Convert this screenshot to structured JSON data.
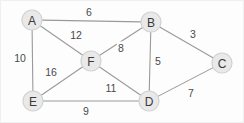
{
  "figure": {
    "background": "#fdfdfd",
    "node_fill": "#e9e9e9",
    "node_stroke": "#d2d2d2",
    "edge_color": "#9a9a9a",
    "text_color": "#3a3a3a"
  },
  "chart_data": {
    "type": "diagram",
    "title": "",
    "graph_type": "weighted-undirected-graph",
    "nodes": [
      {
        "id": "A",
        "label": "A",
        "x": 31,
        "y": 19,
        "r": 10
      },
      {
        "id": "B",
        "label": "B",
        "x": 150,
        "y": 21,
        "r": 10
      },
      {
        "id": "C",
        "label": "C",
        "x": 221,
        "y": 62,
        "r": 10
      },
      {
        "id": "D",
        "label": "D",
        "x": 148,
        "y": 100,
        "r": 10
      },
      {
        "id": "E",
        "label": "E",
        "x": 32,
        "y": 100,
        "r": 10
      },
      {
        "id": "F",
        "label": "F",
        "x": 90,
        "y": 60,
        "r": 10
      }
    ],
    "edges": [
      {
        "source": "A",
        "target": "B",
        "weight": 6,
        "label_x": 88,
        "label_y": 11
      },
      {
        "source": "A",
        "target": "F",
        "weight": 12,
        "label_x": 75,
        "label_y": 34
      },
      {
        "source": "A",
        "target": "E",
        "weight": 10,
        "label_x": 19,
        "label_y": 57
      },
      {
        "source": "B",
        "target": "C",
        "weight": 3,
        "label_x": 192,
        "label_y": 33
      },
      {
        "source": "B",
        "target": "F",
        "weight": 8,
        "label_x": 120,
        "label_y": 47
      },
      {
        "source": "B",
        "target": "D",
        "weight": 5,
        "label_x": 157,
        "label_y": 60
      },
      {
        "source": "C",
        "target": "D",
        "weight": 7,
        "label_x": 190,
        "label_y": 92
      },
      {
        "source": "D",
        "target": "F",
        "weight": 11,
        "label_x": 110,
        "label_y": 87
      },
      {
        "source": "D",
        "target": "E",
        "weight": 9,
        "label_x": 85,
        "label_y": 110
      },
      {
        "source": "E",
        "target": "F",
        "weight": 16,
        "label_x": 50,
        "label_y": 71
      }
    ],
    "node_count": 6,
    "edge_count": 10,
    "weights": [
      6,
      12,
      10,
      3,
      8,
      5,
      7,
      11,
      9,
      16
    ]
  }
}
